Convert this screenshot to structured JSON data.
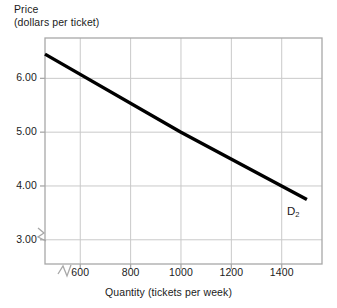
{
  "chart_data": {
    "type": "line",
    "title": "",
    "xlabel": "Quantity (tickets per week)",
    "ylabel_line1": "Price",
    "ylabel_line2": "(dollars per ticket)",
    "xlim": [
      460,
      1560
    ],
    "ylim": [
      2.55,
      6.75
    ],
    "xticks": [
      600,
      800,
      1000,
      1200,
      1400
    ],
    "xtick_labels": [
      "600",
      "800",
      "1000",
      "1200",
      "1400"
    ],
    "yticks": [
      3.0,
      4.0,
      5.0,
      6.0
    ],
    "ytick_labels": [
      "3.00",
      "4.00",
      "5.00",
      "6.00"
    ],
    "grid": true,
    "legend": "none",
    "axis_break_x": true,
    "axis_break_y": true,
    "series": [
      {
        "name": "D2",
        "label": "D",
        "label_sub": "2",
        "color": "#000000",
        "x": [
          460,
          1000,
          1500
        ],
        "values": [
          6.45,
          5.0,
          3.75
        ],
        "linewidth": 3.4
      }
    ],
    "annotations": [
      {
        "text": "D",
        "sub": "2",
        "x": 1520,
        "y": 3.5
      }
    ],
    "colors": {
      "background": "#ffffff",
      "grid": "#c9c9c9",
      "frame": "#a8a8a8",
      "text": "#1b1b1b",
      "curve": "#000000"
    }
  }
}
